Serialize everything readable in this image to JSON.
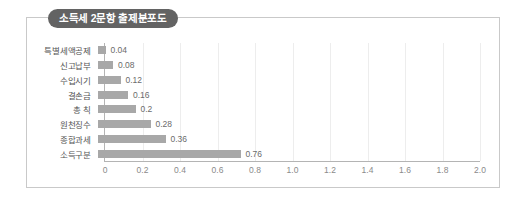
{
  "card": {
    "title": "소득세 2문항 출제분포도",
    "accent_color": "#636363",
    "border_color": "#c9c9c9",
    "bar_color": "#a8a8a8"
  },
  "chart_data": {
    "type": "bar",
    "orientation": "horizontal",
    "title": "소득세 2문항 출제분포도",
    "xlabel": "",
    "ylabel": "",
    "xlim": [
      0,
      2.0
    ],
    "grid": true,
    "legend": "none",
    "categories": [
      "특별세액공제",
      "신고납부",
      "수입시기",
      "결손금",
      "총 칙",
      "원천징수",
      "종합과세",
      "소득구분"
    ],
    "values": [
      0.04,
      0.08,
      0.12,
      0.16,
      0.2,
      0.28,
      0.36,
      0.76
    ],
    "value_labels": [
      "0.04",
      "0.08",
      "0.12",
      "0.16",
      "0.2",
      "0.28",
      "0.36",
      "0.76"
    ],
    "xticks": [
      0,
      0.2,
      0.4,
      0.6,
      0.8,
      1.0,
      1.2,
      1.4,
      1.6,
      1.8,
      2.0
    ],
    "xtick_labels": [
      "0",
      "0.2",
      "0.4",
      "0.6",
      "0.8",
      "1.0",
      "1.2",
      "1.4",
      "1.6",
      "1.8",
      "2.0"
    ]
  }
}
